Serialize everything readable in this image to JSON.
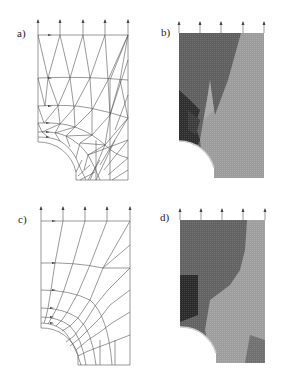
{
  "figure": {
    "panels": [
      {
        "id": "a",
        "label": "a)",
        "type": "mesh-truss",
        "description": "Triangulated strut-and-tie network around quarter circular notch"
      },
      {
        "id": "b",
        "label": "b)",
        "type": "stress-contour",
        "description": "Grayscale stress field for panel a"
      },
      {
        "id": "c",
        "label": "c)",
        "type": "mesh-quad",
        "description": "Radial/orthogonal truss mesh around quarter circular notch"
      },
      {
        "id": "d",
        "label": "d)",
        "type": "stress-contour",
        "description": "Grayscale stress field for panel c"
      }
    ],
    "load_arrows_per_panel": 5,
    "colors": {
      "line": "#555555",
      "dark_region": "#3a3a3a",
      "mid_region": "#6a6a6a",
      "light_region": "#9a9a9a",
      "lighter_region": "#b0b0b0"
    }
  }
}
